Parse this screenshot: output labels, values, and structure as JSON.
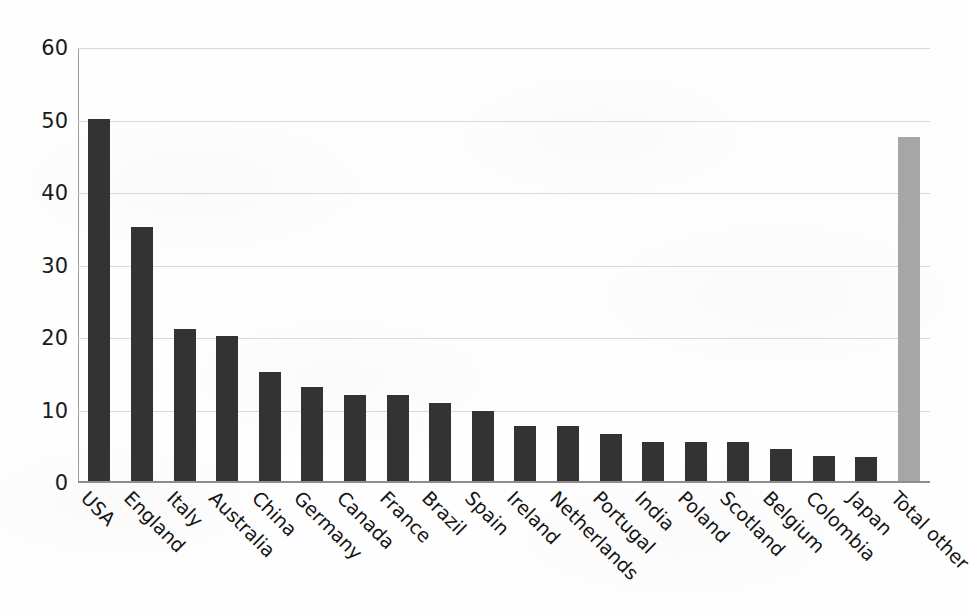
{
  "chart_data": {
    "type": "bar",
    "title": "",
    "subtitle": "",
    "xlabel": "",
    "ylabel": "",
    "ylim": [
      0,
      60
    ],
    "yticks": [
      0,
      10,
      20,
      30,
      40,
      50,
      60
    ],
    "grid": true,
    "legend": "none",
    "categories": [
      "USA",
      "England",
      "Italy",
      "Australia",
      "China",
      "Germany",
      "Canada",
      "France",
      "Brazil",
      "Spain",
      "Ireland",
      "Netherlands",
      "Portugal",
      "India",
      "Poland",
      "Scotland",
      "Belgium",
      "Colombia",
      "Japan",
      "Total other"
    ],
    "values": [
      50,
      35,
      21,
      20,
      15,
      13,
      11.8,
      11.8,
      10.7,
      9.7,
      7.6,
      7.6,
      6.5,
      5.4,
      5.4,
      5.4,
      4.4,
      3.4,
      3.3,
      47.5
    ],
    "bar_colors": [
      "#333333",
      "#333333",
      "#333333",
      "#333333",
      "#333333",
      "#333333",
      "#333333",
      "#333333",
      "#333333",
      "#333333",
      "#333333",
      "#333333",
      "#333333",
      "#333333",
      "#333333",
      "#333333",
      "#333333",
      "#333333",
      "#333333",
      "#a6a6a6"
    ],
    "colors": {
      "bar_primary": "#333333",
      "bar_highlight": "#a6a6a6",
      "gridline": "#d9d9d9",
      "axis": "#8d8d8d",
      "text": "#141414",
      "background": "#fefefe"
    }
  }
}
